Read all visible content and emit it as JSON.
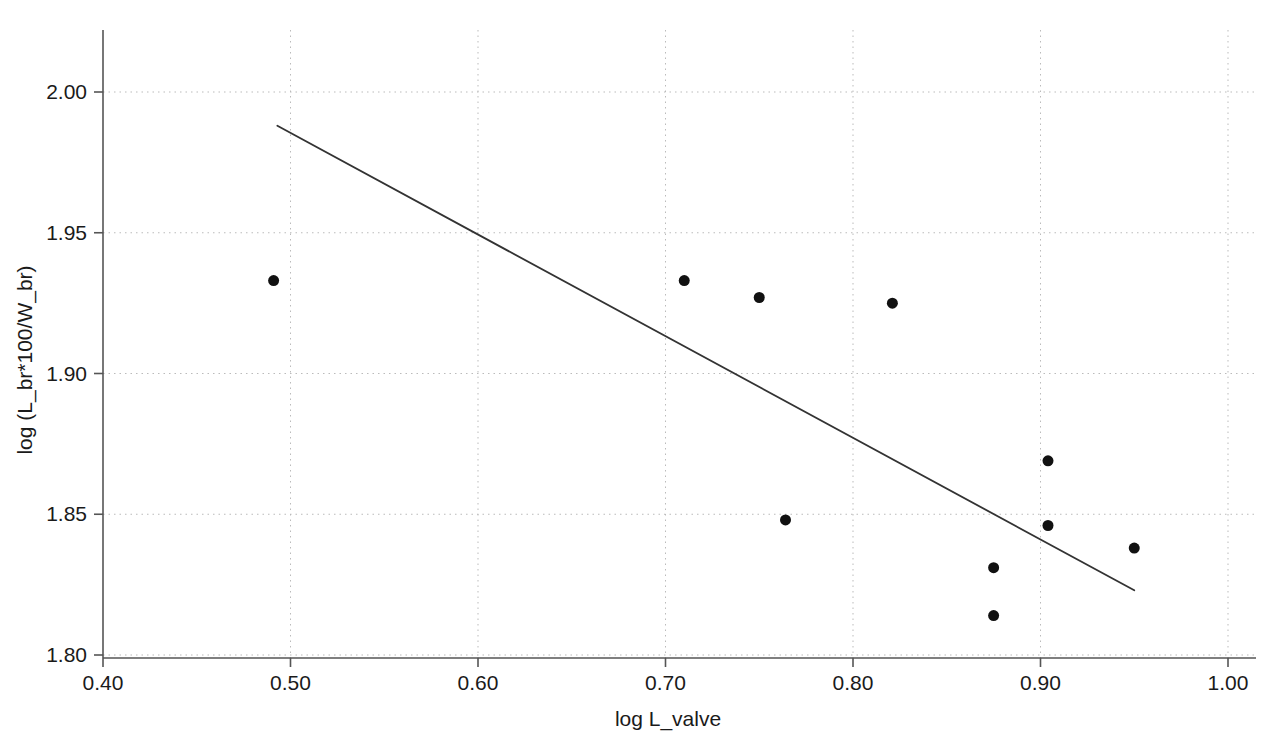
{
  "chart_data": {
    "type": "scatter",
    "title": "",
    "xlabel": "log L_valve",
    "ylabel": "log (L_br*100/W_br)",
    "xlim": [
      0.4,
      1.0
    ],
    "ylim": [
      1.8,
      2.02
    ],
    "xticks": [
      0.4,
      0.5,
      0.6,
      0.7,
      0.8,
      0.9,
      1.0
    ],
    "xtick_labels": [
      "0.40",
      "0.50",
      "0.60",
      "0.70",
      "0.80",
      "0.90",
      "1.00"
    ],
    "yticks": [
      1.8,
      1.85,
      1.9,
      1.95,
      2.0
    ],
    "ytick_labels": [
      "1.80",
      "1.85",
      "1.90",
      "1.95",
      "2.00"
    ],
    "grid": true,
    "grid_style": "dotted",
    "grid_color": "#bbbbbb",
    "legend": null,
    "marker_color": "#111111",
    "marker_size": 11,
    "line_color": "#333333",
    "points": [
      {
        "x": 0.491,
        "y": 1.933
      },
      {
        "x": 0.71,
        "y": 1.933
      },
      {
        "x": 0.75,
        "y": 1.927
      },
      {
        "x": 0.821,
        "y": 1.925
      },
      {
        "x": 0.764,
        "y": 1.848
      },
      {
        "x": 0.904,
        "y": 1.869
      },
      {
        "x": 0.904,
        "y": 1.846
      },
      {
        "x": 0.875,
        "y": 1.831
      },
      {
        "x": 0.875,
        "y": 1.814
      },
      {
        "x": 0.95,
        "y": 1.838
      }
    ],
    "series": [
      {
        "name": "data",
        "x": [
          0.491,
          0.71,
          0.75,
          0.821,
          0.764,
          0.904,
          0.904,
          0.875,
          0.875,
          0.95
        ],
        "values": [
          1.933,
          1.933,
          1.927,
          1.925,
          1.848,
          1.869,
          1.846,
          1.831,
          1.814,
          1.838
        ]
      }
    ],
    "trend_line": {
      "type": "linear-fit",
      "x_start": 0.493,
      "y_start": 1.988,
      "x_end": 0.95,
      "y_end": 1.823,
      "slope": -0.361,
      "intercept": 2.166
    },
    "axes": {
      "x_axis_color": "#555555",
      "y_axis_color": "#555555",
      "tick_direction": "out"
    }
  }
}
